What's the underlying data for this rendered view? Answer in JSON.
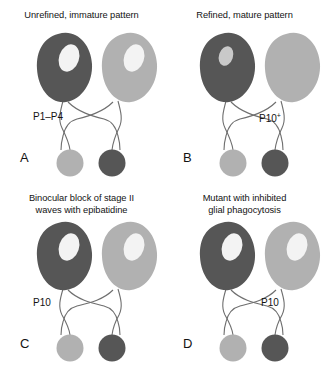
{
  "figure": {
    "caption_letters": [
      "A",
      "B",
      "C",
      "D"
    ],
    "colors": {
      "dark_gray": "#565656",
      "light_gray": "#b1b1b1",
      "inner_pale": "#f3f3f3",
      "inner_pale_mid": "#c9c9c9",
      "fiber_line": "#6f6f6f",
      "background": "#ffffff",
      "text": "#131313"
    },
    "panels": [
      {
        "id": "panel-a",
        "letter": "A",
        "title": "Unrefined, immature pattern",
        "age_label": "P1–P4",
        "age_label_sup": "",
        "age_label_x": 33,
        "age_label_y": 110,
        "left_eye": {
          "fill": "dark_gray",
          "inner": "large",
          "inner_fill": "inner_pale"
        },
        "right_eye": {
          "fill": "light_gray",
          "inner": "large",
          "inner_fill": "inner_pale"
        },
        "left_target": {
          "fill": "light_gray"
        },
        "right_target": {
          "fill": "dark_gray"
        }
      },
      {
        "id": "panel-b",
        "letter": "B",
        "title": "Refined, mature pattern",
        "age_label": "P10",
        "age_label_sup": "+",
        "age_label_x": 96,
        "age_label_y": 112,
        "left_eye": {
          "fill": "dark_gray",
          "inner": "small",
          "inner_fill": "inner_pale_mid"
        },
        "right_eye": {
          "fill": "light_gray",
          "inner": "none",
          "inner_fill": ""
        },
        "left_target": {
          "fill": "light_gray"
        },
        "right_target": {
          "fill": "dark_gray"
        }
      },
      {
        "id": "panel-c",
        "letter": "C",
        "title": "Binocular block of stage II\nwaves with epibatidine",
        "age_label": "P10",
        "age_label_sup": "",
        "age_label_x": 33,
        "age_label_y": 113,
        "left_eye": {
          "fill": "dark_gray",
          "inner": "large",
          "inner_fill": "inner_pale"
        },
        "right_eye": {
          "fill": "light_gray",
          "inner": "large",
          "inner_fill": "inner_pale"
        },
        "left_target": {
          "fill": "light_gray"
        },
        "right_target": {
          "fill": "dark_gray"
        }
      },
      {
        "id": "panel-d",
        "letter": "D",
        "title": "Mutant with inhibited\nglial phagocytosis",
        "age_label": "P10",
        "age_label_sup": "",
        "age_label_x": 98,
        "age_label_y": 113,
        "left_eye": {
          "fill": "dark_gray",
          "inner": "large",
          "inner_fill": "inner_pale"
        },
        "right_eye": {
          "fill": "light_gray",
          "inner": "large",
          "inner_fill": "inner_pale"
        },
        "left_target": {
          "fill": "light_gray"
        },
        "right_target": {
          "fill": "dark_gray"
        }
      }
    ]
  }
}
